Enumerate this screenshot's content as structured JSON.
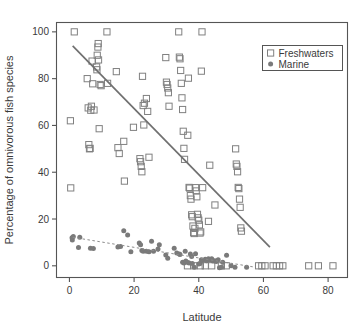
{
  "chart_data": {
    "type": "scatter",
    "title": "",
    "xlabel": "Latitude",
    "ylabel": "Percentage of omnivorous fish species",
    "xlim": [
      -4,
      86
    ],
    "ylim": [
      -5,
      104
    ],
    "xticks": [
      0,
      20,
      40,
      60,
      80
    ],
    "yticks": [
      0,
      20,
      40,
      60,
      80,
      100
    ],
    "xtick_labels": [
      "0",
      "20",
      "40",
      "60",
      "80"
    ],
    "ytick_labels": [
      "0",
      "20",
      "40",
      "60",
      "80",
      "100"
    ],
    "grid": false,
    "legend_position": "top-right",
    "series": [
      {
        "name": "Freshwaters",
        "marker": "open-square",
        "color": "#808080",
        "points": [
          [
            0.4,
            33.3
          ],
          [
            0.3,
            62.0
          ],
          [
            1.5,
            100.0
          ],
          [
            5.5,
            80.0
          ],
          [
            5.8,
            67.5
          ],
          [
            6.0,
            51.8
          ],
          [
            6.2,
            50.0
          ],
          [
            6.4,
            50.2
          ],
          [
            6.6,
            66.5
          ],
          [
            6.8,
            68.2
          ],
          [
            7.0,
            87.5
          ],
          [
            7.2,
            77.8
          ],
          [
            7.6,
            66.6
          ],
          [
            8.4,
            85.0
          ],
          [
            8.5,
            83.8
          ],
          [
            8.6,
            90.0
          ],
          [
            8.8,
            93.5
          ],
          [
            8.9,
            95.0
          ],
          [
            9.0,
            88.0
          ],
          [
            9.2,
            58.6
          ],
          [
            9.5,
            77.5
          ],
          [
            9.8,
            77.0
          ],
          [
            11.6,
            100.0
          ],
          [
            11.8,
            78.0
          ],
          [
            14.5,
            83.0
          ],
          [
            15.0,
            50.5
          ],
          [
            15.4,
            48.0
          ],
          [
            16.8,
            53.2
          ],
          [
            17.0,
            36.2
          ],
          [
            19.8,
            59.2
          ],
          [
            21.8,
            45.8
          ],
          [
            22.0,
            44.5
          ],
          [
            22.2,
            42.5
          ],
          [
            22.4,
            40.2
          ],
          [
            22.6,
            81.0
          ],
          [
            22.8,
            68.5
          ],
          [
            23.0,
            60.2
          ],
          [
            23.2,
            69.5
          ],
          [
            23.8,
            71.5
          ],
          [
            24.2,
            66.0
          ],
          [
            24.6,
            46.4
          ],
          [
            29.8,
            89.0
          ],
          [
            30.0,
            78.5
          ],
          [
            30.2,
            77.5
          ],
          [
            30.4,
            76.0
          ],
          [
            30.6,
            74.0
          ],
          [
            30.8,
            68.2
          ],
          [
            33.8,
            100.0
          ],
          [
            34.0,
            89.2
          ],
          [
            34.2,
            88.5
          ],
          [
            34.4,
            83.5
          ],
          [
            34.6,
            78.0
          ],
          [
            34.8,
            71.8
          ],
          [
            35.0,
            66.8
          ],
          [
            35.2,
            57.5
          ],
          [
            35.4,
            50.2
          ],
          [
            35.6,
            45.5
          ],
          [
            36.6,
            55.8
          ],
          [
            36.8,
            80.2
          ],
          [
            37.0,
            33.5
          ],
          [
            37.2,
            33.2
          ],
          [
            37.4,
            30.0
          ],
          [
            37.6,
            28.5
          ],
          [
            37.8,
            21.8
          ],
          [
            38.0,
            21.0
          ],
          [
            38.2,
            17.0
          ],
          [
            38.4,
            14.2
          ],
          [
            38.6,
            13.8
          ],
          [
            38.8,
            16.0
          ],
          [
            39.0,
            33.4
          ],
          [
            39.2,
            32.0
          ],
          [
            39.4,
            29.5
          ],
          [
            39.6,
            22.0
          ],
          [
            39.8,
            20.5
          ],
          [
            40.0,
            19.5
          ],
          [
            40.2,
            17.5
          ],
          [
            40.4,
            14.0
          ],
          [
            40.6,
            14.5
          ],
          [
            40.8,
            83.2
          ],
          [
            41.0,
            100.0
          ],
          [
            41.2,
            33.4
          ],
          [
            43.0,
            19.0
          ],
          [
            43.4,
            43.0
          ],
          [
            45.0,
            26.0
          ],
          [
            51.4,
            50.0
          ],
          [
            51.6,
            43.5
          ],
          [
            51.8,
            42.5
          ],
          [
            52.0,
            40.2
          ],
          [
            52.2,
            33.5
          ],
          [
            52.4,
            33.0
          ],
          [
            52.6,
            28.5
          ],
          [
            52.8,
            25.0
          ],
          [
            53.0,
            16.2
          ],
          [
            53.2,
            14.8
          ],
          [
            36.5,
            0.0
          ],
          [
            38.5,
            0.0
          ],
          [
            40.5,
            0.0
          ],
          [
            42.0,
            0.0
          ],
          [
            44.0,
            0.0
          ],
          [
            47.0,
            0.0
          ],
          [
            48.5,
            0.0
          ],
          [
            58.5,
            0.0
          ],
          [
            59.5,
            0.0
          ],
          [
            60.5,
            0.0
          ],
          [
            63.0,
            0.0
          ],
          [
            64.0,
            0.0
          ],
          [
            65.0,
            0.0
          ],
          [
            66.0,
            0.0
          ],
          [
            74.0,
            0.0
          ],
          [
            77.0,
            0.0
          ],
          [
            81.5,
            0.0
          ]
        ]
      },
      {
        "name": "Marine",
        "marker": "filled-circle",
        "color": "#7a7a7a",
        "points": [
          [
            0.8,
            12.0
          ],
          [
            0.9,
            11.0
          ],
          [
            1.2,
            12.5
          ],
          [
            2.8,
            7.8
          ],
          [
            3.2,
            12.2
          ],
          [
            6.5,
            7.5
          ],
          [
            7.4,
            7.4
          ],
          [
            15.0,
            8.0
          ],
          [
            15.8,
            8.2
          ],
          [
            16.8,
            15.0
          ],
          [
            18.0,
            13.2
          ],
          [
            19.0,
            6.0
          ],
          [
            21.6,
            9.8
          ],
          [
            22.0,
            9.0
          ],
          [
            22.4,
            6.5
          ],
          [
            22.8,
            6.2
          ],
          [
            23.8,
            6.2
          ],
          [
            24.6,
            6.0
          ],
          [
            25.4,
            10.5
          ],
          [
            26.0,
            6.2
          ],
          [
            27.4,
            7.2
          ],
          [
            27.8,
            9.0
          ],
          [
            29.8,
            4.6
          ],
          [
            30.4,
            3.2
          ],
          [
            32.4,
            7.5
          ],
          [
            33.2,
            5.5
          ],
          [
            34.0,
            5.0
          ],
          [
            34.2,
            4.8
          ],
          [
            35.0,
            1.5
          ],
          [
            35.4,
            1.2
          ],
          [
            35.8,
            6.2
          ],
          [
            36.0,
            2.0
          ],
          [
            36.6,
            1.4
          ],
          [
            37.0,
            1.2
          ],
          [
            37.4,
            5.0
          ],
          [
            37.8,
            4.0
          ],
          [
            38.0,
            1.0
          ],
          [
            38.6,
            -0.6
          ],
          [
            39.0,
            5.2
          ],
          [
            40.0,
            0.8
          ],
          [
            40.4,
            1.0
          ],
          [
            40.8,
            2.6
          ],
          [
            41.2,
            2.4
          ],
          [
            42.0,
            2.8
          ],
          [
            42.4,
            2.2
          ],
          [
            43.0,
            3.0
          ],
          [
            43.4,
            2.5
          ],
          [
            44.0,
            3.0
          ],
          [
            44.4,
            2.0
          ],
          [
            45.0,
            2.2
          ],
          [
            45.4,
            1.8
          ],
          [
            46.0,
            2.6
          ],
          [
            46.4,
            -0.8
          ],
          [
            47.0,
            -0.6
          ],
          [
            47.4,
            1.5
          ],
          [
            48.6,
            4.5
          ],
          [
            50.0,
            0.0
          ],
          [
            51.2,
            -0.6
          ],
          [
            54.8,
            -0.6
          ]
        ]
      }
    ],
    "trend_lines": [
      {
        "name": "freshwaters-regression",
        "style": "solid",
        "color": "#707070",
        "x0": 1.0,
        "y0": 94.0,
        "x1": 62.0,
        "y1": 8.0
      },
      {
        "name": "marine-regression",
        "style": "dashed",
        "color": "#8c8c8c",
        "x0": 1.0,
        "y0": 12.2,
        "x1": 57.0,
        "y1": -0.5
      }
    ],
    "legend": [
      {
        "label": "Freshwaters",
        "marker": "open-square",
        "color": "#808080"
      },
      {
        "label": "Marine",
        "marker": "filled-circle",
        "color": "#7a7a7a"
      }
    ]
  },
  "axes": {
    "frame_color": "#555555",
    "tick_color": "#555555"
  }
}
